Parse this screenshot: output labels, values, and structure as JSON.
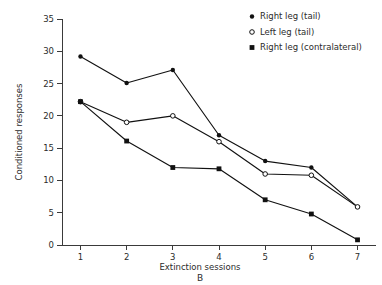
{
  "chart_data": {
    "type": "line",
    "title": "",
    "panel_label": "B",
    "xlabel": "Extinction sessions",
    "ylabel": "Conditioned responses",
    "x": [
      1,
      2,
      3,
      4,
      5,
      6,
      7
    ],
    "xticklabels": [
      "1",
      "2",
      "3",
      "4",
      "5",
      "6",
      "7"
    ],
    "yticks": [
      0,
      5,
      10,
      15,
      20,
      25,
      30,
      35
    ],
    "yticklabels": [
      "0",
      "5",
      "10",
      "15",
      "20",
      "25",
      "30",
      "35"
    ],
    "xlim": [
      0.6,
      7.4
    ],
    "ylim": [
      0,
      35
    ],
    "grid": false,
    "legend_position": "top-right",
    "series": [
      {
        "name": "Right leg (tail)",
        "marker": "filled-circle",
        "color": "#111111",
        "values": [
          29.2,
          25.1,
          27.1,
          17.0,
          13.0,
          12.0,
          5.9
        ]
      },
      {
        "name": "Left leg (tail)",
        "marker": "open-circle",
        "color": "#111111",
        "values": [
          22.2,
          19.0,
          20.0,
          16.0,
          11.0,
          10.8,
          5.9
        ]
      },
      {
        "name": "Right leg (contralateral)",
        "marker": "filled-square",
        "color": "#111111",
        "values": [
          22.2,
          16.1,
          12.0,
          11.8,
          7.0,
          4.8,
          0.8
        ]
      }
    ]
  },
  "legend": {
    "entries": [
      {
        "label": "Right leg (tail)",
        "marker": "filled-circle"
      },
      {
        "label": "Left leg (tail)",
        "marker": "open-circle"
      },
      {
        "label": "Right leg (contralateral)",
        "marker": "filled-square"
      }
    ]
  },
  "colors": {
    "ink": "#111111",
    "axis": "#3a3a3a",
    "text": "#2b2b2b",
    "background": "#ffffff"
  }
}
